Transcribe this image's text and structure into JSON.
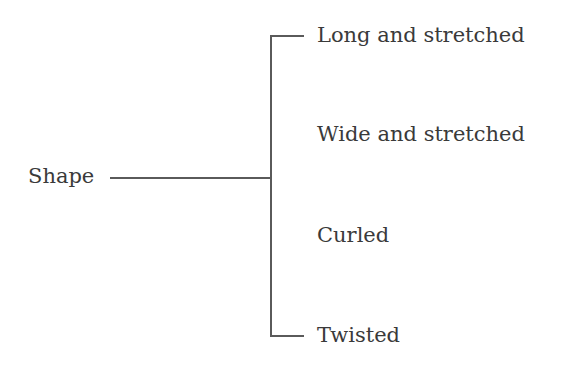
{
  "diagram": {
    "type": "tree",
    "root": {
      "label": "Shape"
    },
    "children": [
      {
        "label": "Long and stretched"
      },
      {
        "label": "Wide and stretched"
      },
      {
        "label": "Curled"
      },
      {
        "label": "Twisted"
      }
    ],
    "colors": {
      "text": "#3a3a3a",
      "lines": "#5a5a5a",
      "background": "#ffffff"
    }
  }
}
